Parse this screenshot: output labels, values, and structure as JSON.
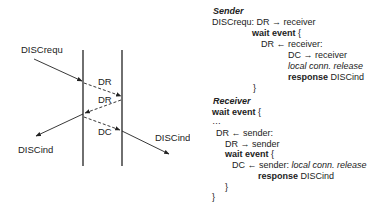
{
  "diagram": {
    "labels": {
      "disc_request_left": "DISCrequ",
      "disc_ind_left": "DISCind",
      "disc_ind_right": "DISCind",
      "msg1": "DR",
      "msg2": "DR",
      "msg3": "DC"
    },
    "colors": {
      "line": "#222222"
    }
  },
  "sender": {
    "title": "Sender",
    "l1_a": "DISCrequ: DR ",
    "l1_arrow": "→",
    "l1_b": " receiver",
    "l2_kw": "wait event",
    "l2_brace": " {",
    "l3_a": "DR ",
    "l3_arrow": "←",
    "l3_b": " receiver:",
    "l4_a": "DC ",
    "l4_arrow": "→",
    "l4_b": " receiver",
    "l5": "local conn. release",
    "l6_kw": "response",
    "l6_b": " DISCind",
    "l7": "}"
  },
  "receiver": {
    "title": "Receiver",
    "l1_kw": "wait event",
    "l1_brace": " {",
    "l2": "…",
    "l3_a": "DR ",
    "l3_arrow": "←",
    "l3_b": " sender:",
    "l4_a": "DR ",
    "l4_arrow": "→",
    "l4_b": " sender",
    "l5_kw": "wait event",
    "l5_brace": " {",
    "l6_a": "DC ",
    "l6_arrow": "←",
    "l6_b": " sender: ",
    "l6_it": "local conn. release",
    "l7_kw": "response",
    "l7_b": " DISCind",
    "l8": "}",
    "l9": "}"
  }
}
